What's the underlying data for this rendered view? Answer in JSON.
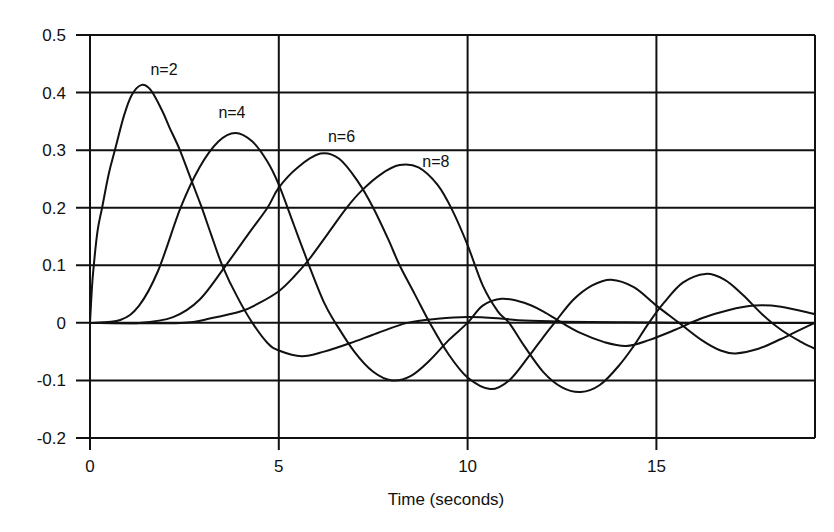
{
  "chart_data": {
    "type": "line",
    "title": "",
    "xlabel": "Time (seconds)",
    "ylabel": "",
    "xlim": [
      0,
      19.2
    ],
    "ylim": [
      -0.2,
      0.5
    ],
    "grid": true,
    "legend_position": "inline labels near peaks",
    "x_ticks": [
      0,
      5,
      10,
      15
    ],
    "x_tick_labels": [
      "0",
      "5",
      "10",
      "15"
    ],
    "y_ticks": [
      0.5,
      0.4,
      0.3,
      0.2,
      0.1,
      0,
      -0.1,
      -0.2
    ],
    "y_tick_labels": [
      "0.5",
      "0.4",
      "0.3",
      "0.2",
      "0.1",
      "0",
      "-0.1",
      "-0.2"
    ],
    "series": [
      {
        "name": "n=2",
        "label_pos": [
          1.6,
          0.43
        ],
        "points": [
          [
            0,
            0
          ],
          [
            0.05,
            0.06
          ],
          [
            0.1,
            0.1
          ],
          [
            0.2,
            0.16
          ],
          [
            0.32,
            0.2
          ],
          [
            0.5,
            0.26
          ],
          [
            0.66,
            0.3
          ],
          [
            0.9,
            0.36
          ],
          [
            1.1,
            0.395
          ],
          [
            1.35,
            0.413
          ],
          [
            1.6,
            0.405
          ],
          [
            1.9,
            0.37
          ],
          [
            2.1,
            0.34
          ],
          [
            2.38,
            0.3
          ],
          [
            2.7,
            0.245
          ],
          [
            2.96,
            0.2
          ],
          [
            3.2,
            0.155
          ],
          [
            3.5,
            0.1
          ],
          [
            3.9,
            0.045
          ],
          [
            4.3,
            0.0
          ],
          [
            4.7,
            -0.035
          ],
          [
            5.0,
            -0.048
          ],
          [
            5.6,
            -0.058
          ],
          [
            6.2,
            -0.05
          ],
          [
            6.9,
            -0.035
          ],
          [
            7.6,
            -0.018
          ],
          [
            8.4,
            0.0
          ],
          [
            9.2,
            0.007
          ],
          [
            10.0,
            0.01
          ],
          [
            10.8,
            0.008
          ],
          [
            11.5,
            0.004
          ],
          [
            12.5,
            0.002
          ],
          [
            14.0,
            0.001
          ],
          [
            16.0,
            0.0
          ],
          [
            19.2,
            0.0
          ]
        ]
      },
      {
        "name": "n=4",
        "label_pos": [
          3.4,
          0.355
        ],
        "points": [
          [
            0,
            0
          ],
          [
            0.8,
            0.005
          ],
          [
            1.3,
            0.03
          ],
          [
            1.8,
            0.09
          ],
          [
            2.4,
            0.2
          ],
          [
            2.9,
            0.27
          ],
          [
            3.4,
            0.315
          ],
          [
            3.85,
            0.33
          ],
          [
            4.3,
            0.315
          ],
          [
            4.7,
            0.28
          ],
          [
            5.0,
            0.24
          ],
          [
            5.4,
            0.17
          ],
          [
            5.8,
            0.1
          ],
          [
            6.2,
            0.035
          ],
          [
            6.5,
            0.0
          ],
          [
            7.0,
            -0.05
          ],
          [
            7.5,
            -0.085
          ],
          [
            8.0,
            -0.1
          ],
          [
            8.5,
            -0.092
          ],
          [
            9.0,
            -0.065
          ],
          [
            9.5,
            -0.03
          ],
          [
            10.0,
            0.0
          ],
          [
            10.4,
            0.03
          ],
          [
            10.9,
            0.042
          ],
          [
            11.5,
            0.035
          ],
          [
            12.0,
            0.02
          ],
          [
            12.5,
            0.0
          ],
          [
            13.0,
            -0.018
          ],
          [
            13.6,
            -0.033
          ],
          [
            14.2,
            -0.04
          ],
          [
            14.8,
            -0.03
          ],
          [
            15.5,
            -0.012
          ],
          [
            16.2,
            0.008
          ],
          [
            16.9,
            0.022
          ],
          [
            17.6,
            0.03
          ],
          [
            18.3,
            0.028
          ],
          [
            19.2,
            0.015
          ]
        ]
      },
      {
        "name": "n=6",
        "label_pos": [
          6.3,
          0.315
        ],
        "points": [
          [
            0,
            0
          ],
          [
            1.3,
            0.0
          ],
          [
            2.2,
            0.01
          ],
          [
            2.9,
            0.04
          ],
          [
            3.6,
            0.1
          ],
          [
            4.2,
            0.155
          ],
          [
            4.7,
            0.2
          ],
          [
            5.0,
            0.235
          ],
          [
            5.5,
            0.27
          ],
          [
            6.1,
            0.294
          ],
          [
            6.6,
            0.285
          ],
          [
            7.1,
            0.245
          ],
          [
            7.5,
            0.2
          ],
          [
            7.9,
            0.145
          ],
          [
            8.2,
            0.1
          ],
          [
            8.6,
            0.05
          ],
          [
            9.0,
            0.0
          ],
          [
            9.5,
            -0.055
          ],
          [
            10.0,
            -0.095
          ],
          [
            10.6,
            -0.115
          ],
          [
            11.1,
            -0.1
          ],
          [
            11.6,
            -0.06
          ],
          [
            12.0,
            -0.025
          ],
          [
            12.3,
            0.0
          ],
          [
            12.8,
            0.04
          ],
          [
            13.3,
            0.065
          ],
          [
            13.8,
            0.075
          ],
          [
            14.4,
            0.062
          ],
          [
            15.0,
            0.03
          ],
          [
            15.6,
            0.0
          ],
          [
            16.2,
            -0.03
          ],
          [
            16.7,
            -0.048
          ],
          [
            17.1,
            -0.053
          ],
          [
            17.7,
            -0.045
          ],
          [
            18.3,
            -0.028
          ],
          [
            18.8,
            -0.012
          ],
          [
            19.2,
            0.0
          ]
        ]
      },
      {
        "name": "n=8",
        "label_pos": [
          8.8,
          0.27
        ],
        "points": [
          [
            0,
            0
          ],
          [
            2.4,
            0.0
          ],
          [
            3.2,
            0.008
          ],
          [
            4.0,
            0.02
          ],
          [
            4.5,
            0.035
          ],
          [
            5.0,
            0.055
          ],
          [
            5.4,
            0.08
          ],
          [
            5.8,
            0.11
          ],
          [
            6.3,
            0.155
          ],
          [
            6.8,
            0.2
          ],
          [
            7.2,
            0.23
          ],
          [
            7.7,
            0.258
          ],
          [
            8.2,
            0.274
          ],
          [
            8.7,
            0.27
          ],
          [
            9.2,
            0.24
          ],
          [
            9.6,
            0.195
          ],
          [
            10.0,
            0.135
          ],
          [
            10.4,
            0.065
          ],
          [
            10.8,
            0.02
          ],
          [
            11.1,
            0.0
          ],
          [
            11.5,
            -0.04
          ],
          [
            12.0,
            -0.085
          ],
          [
            12.5,
            -0.112
          ],
          [
            13.0,
            -0.12
          ],
          [
            13.5,
            -0.108
          ],
          [
            14.0,
            -0.075
          ],
          [
            14.4,
            -0.04
          ],
          [
            14.8,
            0.0
          ],
          [
            15.2,
            0.035
          ],
          [
            15.7,
            0.07
          ],
          [
            16.3,
            0.085
          ],
          [
            16.8,
            0.075
          ],
          [
            17.3,
            0.048
          ],
          [
            17.8,
            0.015
          ],
          [
            18.3,
            -0.012
          ],
          [
            18.8,
            -0.032
          ],
          [
            19.2,
            -0.045
          ]
        ]
      }
    ]
  },
  "plot_area": {
    "left_px": 90,
    "right_px": 815,
    "top_px": 35,
    "bottom_px": 438
  },
  "colors": {
    "line": "#111111",
    "background": "#ffffff"
  }
}
